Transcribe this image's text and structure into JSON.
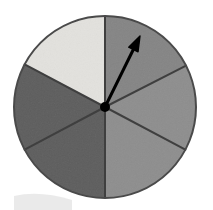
{
  "figure": {
    "kind": "probability-spinner",
    "background_color": "#ffffff"
  },
  "chart_data": {
    "type": "pie",
    "title": "",
    "subtitle": "",
    "xlabel": "",
    "ylabel": "",
    "legend_position": "none",
    "grid": false,
    "center": {
      "x": 105,
      "y": 107
    },
    "radius": 91,
    "outline_color": "#4a4a4a",
    "outline_width": 2,
    "categories": [
      "upper-left-sector",
      "upper-right-sector",
      "right-sector",
      "lower-right-sector",
      "lower-left-sector",
      "left-sector"
    ],
    "values": [
      62,
      63,
      55,
      62,
      62,
      56
    ],
    "sectors": [
      {
        "name": "upper-left-sector",
        "start_angle_deg": 90,
        "end_angle_deg": 152,
        "sweep_deg": 62,
        "color": "#e3e2de",
        "shade": "very light gray"
      },
      {
        "name": "left-sector",
        "start_angle_deg": 152,
        "end_angle_deg": 208,
        "sweep_deg": 56,
        "color": "#5e5e5e",
        "shade": "dark gray"
      },
      {
        "name": "lower-left-sector",
        "start_angle_deg": 208,
        "end_angle_deg": 270,
        "sweep_deg": 62,
        "color": "#5e5e5e",
        "shade": "dark gray"
      },
      {
        "name": "lower-right-sector",
        "start_angle_deg": 270,
        "end_angle_deg": 332,
        "sweep_deg": 62,
        "color": "#8e8e8e",
        "shade": "medium gray"
      },
      {
        "name": "right-sector",
        "start_angle_deg": 332,
        "end_angle_deg": 27,
        "sweep_deg": 55,
        "color": "#8e8e8e",
        "shade": "medium gray"
      },
      {
        "name": "upper-right-sector",
        "start_angle_deg": 27,
        "end_angle_deg": 90,
        "sweep_deg": 63,
        "color": "#858585",
        "shade": "medium gray"
      }
    ],
    "divider_lines": [
      {
        "name": "divider-vertical-up",
        "angle_deg": 90
      },
      {
        "name": "divider-upper-left",
        "angle_deg": 152
      },
      {
        "name": "divider-lower-left",
        "angle_deg": 208
      },
      {
        "name": "divider-vertical-down",
        "angle_deg": 270
      },
      {
        "name": "divider-lower-right",
        "angle_deg": 332
      },
      {
        "name": "divider-upper-right",
        "angle_deg": 27
      }
    ],
    "pointer": {
      "name": "spinner-arrow",
      "angle_deg": 63.8,
      "tip_x": 140,
      "tip_y": 36,
      "length": 79,
      "color": "#000000",
      "shaft_width": 3,
      "points_into_sector": "upper-right-sector"
    },
    "hub": {
      "name": "spinner-hub",
      "x": 105,
      "y": 107,
      "radius": 5,
      "color": "#000000"
    }
  }
}
